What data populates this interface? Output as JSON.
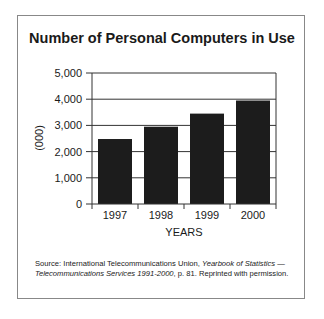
{
  "chart_data": {
    "type": "bar",
    "title": "Number of Personal Computers in Use",
    "xlabel": "YEARS",
    "ylabel": "(000)",
    "categories": [
      "1997",
      "1998",
      "1999",
      "2000"
    ],
    "values": [
      2480,
      2950,
      3450,
      3950
    ],
    "ylim": [
      0,
      5000
    ],
    "yticks": [
      "0",
      "1,000",
      "2,000",
      "3,000",
      "4,000",
      "5,000"
    ],
    "grid": true,
    "bar_color": "#1c1c1c"
  },
  "source": {
    "prefix": "Source: International Telecommunications Union, ",
    "italic": "Yearbook of Statistics — Telecommunications Services 1991-2000",
    "suffix": ", p. 81. Reprinted with permission."
  }
}
